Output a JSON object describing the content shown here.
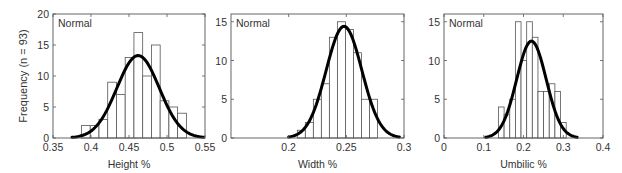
{
  "figure": {
    "shared_ylabel": "Frequency (n = 93)"
  },
  "chart_data": [
    {
      "type": "bar",
      "subtype": "histogram-with-normal-fit",
      "annotation": "Normal",
      "xlabel": "Height %",
      "ylabel": "Frequency (n = 93)",
      "xlim": [
        0.35,
        0.55
      ],
      "ylim": [
        0,
        20
      ],
      "xticks": [
        "0.35",
        "0.4",
        "0.45",
        "0.5",
        "0.55"
      ],
      "xtick_values": [
        0.35,
        0.4,
        0.45,
        0.5,
        0.55
      ],
      "yticks": [
        "0",
        "5",
        "10",
        "15",
        "20"
      ],
      "ytick_values": [
        0,
        5,
        10,
        15,
        20
      ],
      "bin_start": 0.3875,
      "bin_width": 0.0115,
      "counts": [
        2,
        2,
        3,
        9,
        7,
        13,
        17,
        10,
        15,
        6,
        5,
        4
      ],
      "fit": {
        "mean": 0.462,
        "peak": 13.3,
        "range": [
          0.375,
          0.548
        ]
      }
    },
    {
      "type": "bar",
      "subtype": "histogram-with-normal-fit",
      "annotation": "Normal",
      "xlabel": "Width %",
      "ylabel": "",
      "xlim": [
        0.15,
        0.3
      ],
      "ylim": [
        0,
        16
      ],
      "xticks": [
        "0.2",
        "0.25",
        "0.3"
      ],
      "xtick_values": [
        0.2,
        0.25,
        0.3
      ],
      "yticks": [
        "0",
        "5",
        "10",
        "15"
      ],
      "ytick_values": [
        0,
        5,
        10,
        15
      ],
      "bin_start": 0.2075,
      "bin_width": 0.00695,
      "counts": [
        1,
        2,
        5,
        7,
        13,
        15,
        14,
        11,
        5,
        5,
        0
      ],
      "fit": {
        "mean": 0.248,
        "peak": 14.4,
        "range": [
          0.2,
          0.296
        ]
      }
    },
    {
      "type": "bar",
      "subtype": "histogram-with-normal-fit",
      "annotation": "Normal",
      "xlabel": "Umbilic %",
      "ylabel": "",
      "xlim": [
        0,
        0.4
      ],
      "ylim": [
        0,
        16
      ],
      "xticks": [
        "0",
        "0.1",
        "0.2",
        "0.3",
        "0.4"
      ],
      "xtick_values": [
        0,
        0.1,
        0.2,
        0.3,
        0.4
      ],
      "yticks": [
        "0",
        "5",
        "10",
        "15"
      ],
      "ytick_values": [
        0,
        5,
        10,
        15
      ],
      "bin_start": 0.137,
      "bin_width": 0.0142,
      "counts": [
        4,
        3,
        5,
        15,
        10,
        15,
        13,
        6,
        6,
        7,
        6,
        2
      ],
      "fit": {
        "mean": 0.22,
        "peak": 12.5,
        "range": [
          0.105,
          0.335
        ]
      }
    }
  ]
}
